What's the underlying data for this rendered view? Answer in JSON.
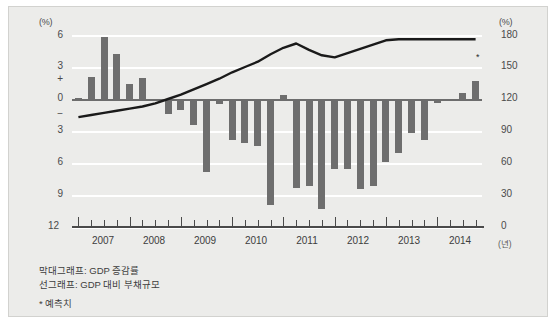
{
  "axes": {
    "left_unit": "(%)",
    "right_unit": "(%)",
    "left_ticks": [
      "6",
      "3",
      "0",
      "3",
      "6",
      "9",
      "12"
    ],
    "sign_plus": "+",
    "sign_minus": "−",
    "right_ticks": [
      "180",
      "150",
      "120",
      "90",
      "60",
      "30",
      "0"
    ],
    "x_labels": [
      "2007",
      "2008",
      "2009",
      "2010",
      "2011",
      "2012",
      "2013",
      "2014"
    ],
    "x_unit": "(년)"
  },
  "caption": {
    "line1": "막대그래프: GDP 증감률",
    "line2": "선그래프: GDP 대비 부채규모",
    "note": "* 예측치",
    "forecast_marker": "*"
  },
  "colors": {
    "background": "#ececea",
    "bar": "#6e6e6e",
    "line": "#1a1a1a",
    "grid": "#ffffff",
    "axis": "#4a4a4a"
  },
  "chart_data": {
    "type": "bar",
    "title": "",
    "subtitle": "",
    "xlabel": "(년)",
    "ylabel": "(%)",
    "ylim": [
      -12,
      6
    ],
    "y2lim": [
      0,
      180
    ],
    "grid": true,
    "legend_position": "below-plot",
    "categories": [
      "2007Q1",
      "2007Q2",
      "2007Q3",
      "2007Q4",
      "2008Q1",
      "2008Q2",
      "2008Q3",
      "2008Q4",
      "2009Q1",
      "2009Q2",
      "2009Q3",
      "2009Q4",
      "2010Q1",
      "2010Q2",
      "2010Q3",
      "2010Q4",
      "2011Q1",
      "2011Q2",
      "2011Q3",
      "2011Q4",
      "2012Q1",
      "2012Q2",
      "2012Q3",
      "2012Q4",
      "2013Q1",
      "2013Q2",
      "2013Q3",
      "2013Q4",
      "2014Q1",
      "2014Q2",
      "2014Q3",
      "2014Q4"
    ],
    "series": [
      {
        "name": "막대그래프: GDP 증감률",
        "type": "bar",
        "axis": "left",
        "unit": "%",
        "values": [
          0.1,
          2.1,
          5.8,
          4.2,
          1.4,
          2.0,
          -0.2,
          -1.4,
          -1.0,
          -2.4,
          -6.8,
          -0.5,
          -3.8,
          -4.1,
          -4.4,
          -9.9,
          0.4,
          -8.3,
          -8.2,
          -10.3,
          -6.6,
          -6.6,
          -8.4,
          -8.2,
          -5.9,
          -5.1,
          -3.2,
          -3.8,
          -0.4,
          -0.2,
          0.6,
          1.7
        ]
      },
      {
        "name": "선그래프: GDP 대비 부채규모",
        "type": "line",
        "axis": "right",
        "unit": "%",
        "values": [
          103,
          105,
          107,
          109,
          111,
          113,
          116,
          120,
          124,
          129,
          134,
          139,
          145,
          150,
          155,
          162,
          168,
          172,
          166,
          161,
          159,
          163,
          167,
          171,
          175,
          176,
          176,
          176,
          176,
          176,
          176,
          176
        ]
      }
    ]
  }
}
